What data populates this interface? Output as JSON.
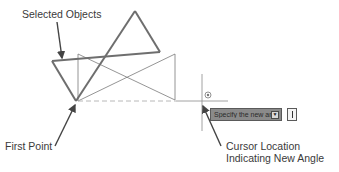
{
  "annotations": {
    "selected_objects": "Selected Objects",
    "first_point": "First Point",
    "cursor_location_line1": "Cursor Location",
    "cursor_location_line2": "Indicating New Angle"
  },
  "dynamic_input": {
    "prompt": "Specify the new angle or",
    "dropdown_icon": "down-arrow-icon",
    "value": ""
  },
  "cursor": {
    "icon": "rotate-cursor-icon"
  },
  "colors": {
    "thick_line": "#6e6e6e",
    "thin_line": "#7a7a7a",
    "dashed_line": "#b8b8b8",
    "arrow": "#444444",
    "tooltip_bg": "#8a8a8a"
  }
}
